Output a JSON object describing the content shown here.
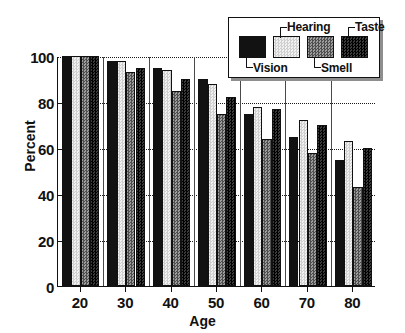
{
  "chart_data": {
    "type": "bar",
    "title": "",
    "xlabel": "Age",
    "ylabel": "Percent",
    "categories": [
      "20",
      "30",
      "40",
      "50",
      "60",
      "70",
      "80"
    ],
    "ylim": [
      0,
      100
    ],
    "yticks": [
      0,
      20,
      40,
      60,
      80,
      100
    ],
    "grid": true,
    "gridlines_at": [
      20,
      40,
      60,
      80,
      100
    ],
    "legend_position": "top-right",
    "series": [
      {
        "name": "Vision",
        "color": "#121212",
        "pattern": "solid",
        "values": [
          100,
          98,
          95,
          90,
          75,
          65,
          55
        ]
      },
      {
        "name": "Hearing",
        "color": "#e4e4e4",
        "pattern": "light-checker",
        "values": [
          100,
          98,
          94,
          88,
          78,
          72,
          63
        ]
      },
      {
        "name": "Smell",
        "color": "#7a7a7a",
        "pattern": "medium-checker",
        "values": [
          100,
          93,
          85,
          75,
          64,
          58,
          43
        ]
      },
      {
        "name": "Taste",
        "color": "#1e1e1e",
        "pattern": "dark-checker",
        "values": [
          100,
          95,
          90,
          82,
          77,
          70,
          60
        ]
      }
    ]
  },
  "legend": {
    "entries": [
      {
        "label": "Vision",
        "position": "bottom"
      },
      {
        "label": "Hearing",
        "position": "top"
      },
      {
        "label": "Smell",
        "position": "bottom"
      },
      {
        "label": "Taste",
        "position": "top"
      }
    ]
  },
  "axes": {
    "y_title": "Percent",
    "x_title": "Age",
    "y_tick_labels": [
      "0",
      "20",
      "40",
      "60",
      "80",
      "100"
    ],
    "x_tick_labels": [
      "20",
      "30",
      "40",
      "50",
      "60",
      "70",
      "80"
    ]
  }
}
